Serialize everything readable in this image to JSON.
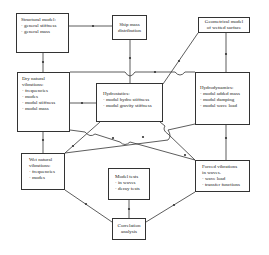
{
  "diagram": {
    "boxes": {
      "structural_model": {
        "title": "Structural model:",
        "items": [
          "· general stiffness",
          "· general mass"
        ]
      },
      "ship_mass": {
        "title": "Ship mass",
        "title2": "distribution"
      },
      "geometrical_model": {
        "title": "Geometrical model",
        "title2": "of wetted surface"
      },
      "dry_natural": {
        "title": "Dry natural",
        "title2": "vibrations:",
        "items": [
          "· frequencies",
          "· modes",
          "· modal stiffness",
          "· modal mass"
        ]
      },
      "hydrostatics": {
        "title": "Hydrostatics:",
        "items": [
          "· modal hydro stiffness",
          "· modal gravity stiffness"
        ]
      },
      "hydrodynamics": {
        "title": "Hydrodynamics:",
        "items": [
          "· modal added mass",
          "· modal damping",
          "· modal wave load"
        ]
      },
      "wet_natural": {
        "title": "Wet natural",
        "title2": "vibrations:",
        "items": [
          "· frequencies",
          "· modes"
        ]
      },
      "model_tests": {
        "title": "Model tests",
        "items": [
          "· in waves",
          "· decay tests"
        ]
      },
      "forced_vibrations": {
        "title": "Forced vibrations",
        "title2": "in waves.",
        "items": [
          "· wave load",
          "· transfer functions"
        ]
      },
      "correlation": {
        "title": "Correlation",
        "title2": "analysis"
      }
    },
    "colors": {
      "line": "#333333",
      "box_border": "#333333",
      "background": "#ffffff"
    }
  }
}
